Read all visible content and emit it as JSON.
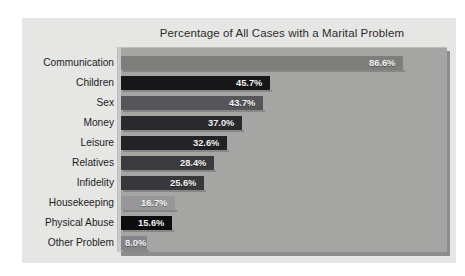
{
  "figure": {
    "background_color": "#ffffff",
    "panel_color": "#e6e6e4",
    "plot_background_color": "#a5a5a3"
  },
  "chart_data": {
    "type": "bar",
    "orientation": "horizontal",
    "title": "Percentage of All Cases with a Marital Problem",
    "subtitle": "",
    "xlabel": "",
    "ylabel": "",
    "xlim": [
      0,
      100
    ],
    "grid": false,
    "legend": false,
    "categories": [
      "Communication",
      "Children",
      "Sex",
      "Money",
      "Leisure",
      "Relatives",
      "Infidelity",
      "Housekeeping",
      "Physical Abuse",
      "Other Problem"
    ],
    "values": [
      86.6,
      45.7,
      43.7,
      37.0,
      32.6,
      28.4,
      25.6,
      16.7,
      15.6,
      8.0
    ],
    "value_labels": [
      "86.6%",
      "45.7%",
      "43.7%",
      "37.0%",
      "32.6%",
      "28.4%",
      "25.6%",
      "16.7%",
      "15.6%",
      "8.0%"
    ],
    "bar_colors": [
      "#7e7e7c",
      "#17171a",
      "#55555a",
      "#2a2a2e",
      "#232327",
      "#3b3b3f",
      "#38383c",
      "#97979a",
      "#0d0d10",
      "#84848a"
    ]
  },
  "bars": [
    {
      "label": "Communication",
      "value": 86.6,
      "value_label": "86.6%",
      "color": "#7e7e7c"
    },
    {
      "label": "Children",
      "value": 45.7,
      "value_label": "45.7%",
      "color": "#17171a"
    },
    {
      "label": "Sex",
      "value": 43.7,
      "value_label": "43.7%",
      "color": "#55555a"
    },
    {
      "label": "Money",
      "value": 37.0,
      "value_label": "37.0%",
      "color": "#2a2a2e"
    },
    {
      "label": "Leisure",
      "value": 32.6,
      "value_label": "32.6%",
      "color": "#232327"
    },
    {
      "label": "Relatives",
      "value": 28.4,
      "value_label": "28.4%",
      "color": "#3b3b3f"
    },
    {
      "label": "Infidelity",
      "value": 25.6,
      "value_label": "25.6%",
      "color": "#38383c"
    },
    {
      "label": "Housekeeping",
      "value": 16.7,
      "value_label": "16.7%",
      "color": "#97979a"
    },
    {
      "label": "Physical Abuse",
      "value": 15.6,
      "value_label": "15.6%",
      "color": "#0d0d10"
    },
    {
      "label": "Other Problem",
      "value": 8.0,
      "value_label": "8.0%",
      "color": "#84848a"
    }
  ]
}
